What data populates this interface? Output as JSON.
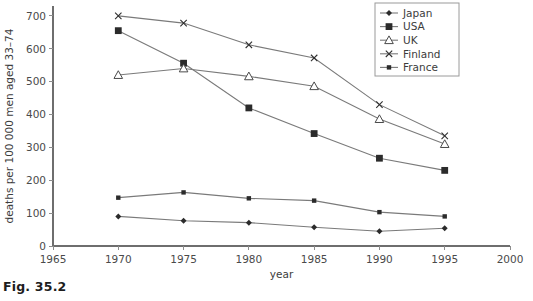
{
  "caption": "Fig. 35.2",
  "chart_data": {
    "type": "line",
    "title": "",
    "xlabel": "year",
    "ylabel": "deaths per 100 000 men aged 33–74",
    "x": [
      1970,
      1975,
      1980,
      1985,
      1990,
      1995
    ],
    "xlim": [
      1965,
      2000
    ],
    "ylim": [
      0,
      730
    ],
    "xticks": [
      1965,
      1970,
      1975,
      1980,
      1985,
      1990,
      1995,
      2000
    ],
    "xtick_labels": [
      "1965",
      "1970",
      "1975",
      "1980",
      "1985",
      "1990",
      "1995",
      "2000"
    ],
    "yticks": [
      0,
      100,
      200,
      300,
      400,
      500,
      600,
      700
    ],
    "ytick_labels": [
      "0",
      "100",
      "200",
      "300",
      "400",
      "500",
      "600",
      "700"
    ],
    "grid": false,
    "legend_position": "top-right",
    "series": [
      {
        "name": "Japan",
        "marker": "diamond-small-filled",
        "values": [
          90,
          77,
          71,
          57,
          45,
          54
        ]
      },
      {
        "name": "USA",
        "marker": "square-filled",
        "values": [
          655,
          556,
          420,
          342,
          267,
          230
        ]
      },
      {
        "name": "UK",
        "marker": "triangle-open",
        "values": [
          520,
          540,
          516,
          486,
          386,
          310
        ]
      },
      {
        "name": "Finland",
        "marker": "cross-x",
        "values": [
          700,
          678,
          612,
          572,
          430,
          335
        ]
      },
      {
        "name": "France",
        "marker": "square-small-filled",
        "values": [
          147,
          163,
          145,
          138,
          103,
          90
        ]
      }
    ]
  },
  "colors": {
    "line": "#7a7a7a",
    "marker": "#2b2b2b",
    "axis": "#6e6e6e",
    "text": "#3c3c3c",
    "background": "#ffffff"
  }
}
